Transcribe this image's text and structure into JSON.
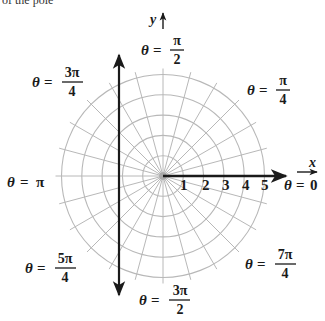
{
  "caption_fragment": "of the pole",
  "diagram": {
    "type": "polar-grid",
    "center": {
      "x": 163,
      "y": 176
    },
    "ring_count": 5,
    "ring_spacing_px": 20.3,
    "spoke_angle_step_deg": 15,
    "colors": {
      "grid": "#b8b8b8",
      "axis": "#1a1a1a",
      "background": "#ffffff"
    }
  },
  "axes": {
    "x_label": "x",
    "y_label": "y",
    "radial_ticks": [
      "1",
      "2",
      "3",
      "4",
      "5"
    ]
  },
  "angle_labels": {
    "zero": {
      "theta": "θ",
      "eq": "=",
      "value": "0"
    },
    "pi": {
      "theta": "θ",
      "eq": "=",
      "value": "π"
    },
    "pi_2": {
      "theta": "θ",
      "eq": "=",
      "num": "π",
      "den": "2"
    },
    "pi_4": {
      "theta": "θ",
      "eq": "=",
      "num": "π",
      "den": "4"
    },
    "3pi_4": {
      "theta": "θ",
      "eq": "=",
      "num": "3π",
      "den": "4"
    },
    "5pi_4": {
      "theta": "θ",
      "eq": "=",
      "num": "5π",
      "den": "4"
    },
    "3pi_2": {
      "theta": "θ",
      "eq": "=",
      "num": "3π",
      "den": "2"
    },
    "7pi_4": {
      "theta": "θ",
      "eq": "=",
      "num": "7π",
      "den": "4"
    }
  }
}
